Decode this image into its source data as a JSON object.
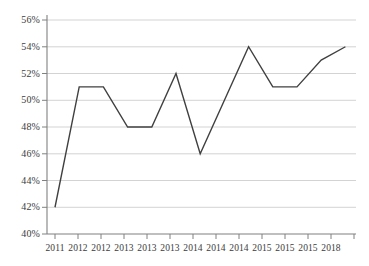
{
  "chart_data": {
    "type": "line",
    "title": "",
    "subtitle": "",
    "xlabel": "",
    "ylabel": "",
    "x": [
      "2011",
      "2012",
      "2012",
      "2013",
      "2013",
      "2013",
      "2014",
      "2014",
      "2014",
      "2015",
      "2015",
      "2015",
      "2018"
    ],
    "categories": [
      "2011",
      "2012",
      "2012",
      "2013",
      "2013",
      "2013",
      "2014",
      "2014",
      "2014",
      "2015",
      "2015",
      "2015",
      "2018"
    ],
    "values": [
      42,
      51,
      51,
      48,
      48,
      52,
      46,
      50,
      54,
      51,
      51,
      53,
      54
    ],
    "series": [
      {
        "name": "series-1",
        "values": [
          42,
          51,
          51,
          48,
          48,
          52,
          46,
          50,
          54,
          51,
          51,
          53,
          54
        ]
      }
    ],
    "ylim": [
      40,
      56
    ],
    "ytick_step": 2,
    "ytick_labels": [
      "56%",
      "54%",
      "52%",
      "50%",
      "48%",
      "46%",
      "44%",
      "42%",
      "40%"
    ],
    "ytick_values": [
      56,
      54,
      52,
      50,
      48,
      46,
      44,
      42,
      40
    ],
    "xtick_labels": [
      "2011",
      "2012",
      "2012",
      "2013",
      "2013",
      "2013",
      "2014",
      "2014",
      "2014",
      "2015",
      "2015",
      "2015",
      "2018"
    ],
    "grid": true,
    "grid_axis": "y",
    "legend": false,
    "legend_position": "none",
    "line_color": "#404040",
    "grid_color": "#c8c8c8",
    "axis_color": "#808080",
    "text_color": "#3b3b3b",
    "background_color": "#ffffff",
    "markers": false
  }
}
